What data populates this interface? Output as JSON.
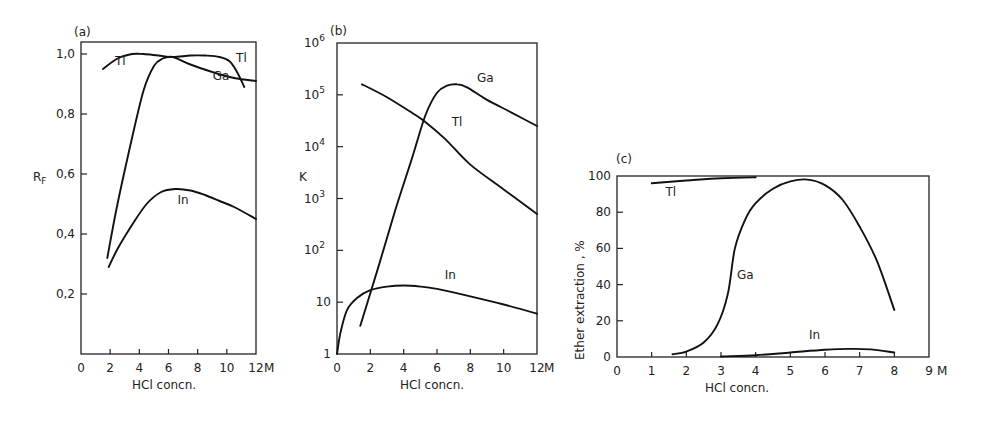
{
  "figure": {
    "panels": [
      "(a)",
      "(b)",
      "(c)"
    ]
  },
  "chart_data": [
    {
      "type": "line",
      "panel": "(a)",
      "title": "",
      "xlabel": "HCl concn.",
      "x_unit": "M",
      "ylabel": "RF",
      "xlim": [
        0,
        12
      ],
      "ylim": [
        0,
        1.05
      ],
      "x_ticks": [
        0,
        2,
        4,
        6,
        8,
        10,
        12
      ],
      "x_tick_labels": [
        "0",
        "2",
        "4",
        "6",
        "8",
        "10",
        "12"
      ],
      "y_ticks": [
        0.2,
        0.4,
        0.6,
        0.8,
        1.0
      ],
      "y_tick_labels": [
        "0,2",
        "0,4",
        "0,6",
        "0,8",
        "1,0"
      ],
      "grid": false,
      "series": [
        {
          "name": "Tl",
          "x": [
            1.5,
            2.5,
            3.5,
            4.3,
            5.3,
            6.3,
            7.5,
            8.5,
            9.5,
            10.2,
            10.7,
            11.2
          ],
          "y": [
            0.95,
            0.985,
            1.0,
            1.0,
            0.995,
            0.99,
            0.995,
            0.995,
            0.99,
            0.975,
            0.94,
            0.89
          ]
        },
        {
          "name": "Ga",
          "x": [
            1.8,
            2.5,
            3.5,
            4.3,
            5.0,
            5.6,
            6.3,
            7.5,
            9.0,
            10.5,
            12.0
          ],
          "y": [
            0.32,
            0.5,
            0.72,
            0.88,
            0.96,
            0.985,
            0.99,
            0.965,
            0.94,
            0.92,
            0.91
          ]
        },
        {
          "name": "In",
          "x": [
            1.9,
            2.5,
            3.5,
            4.5,
            5.5,
            6.5,
            7.5,
            8.5,
            9.5,
            10.5,
            12.0
          ],
          "y": [
            0.29,
            0.35,
            0.43,
            0.5,
            0.54,
            0.55,
            0.545,
            0.53,
            0.51,
            0.49,
            0.45
          ]
        }
      ],
      "annotations": [
        {
          "text": "Tl",
          "x": 2.7,
          "y": 0.965
        },
        {
          "text": "Tl",
          "x": 11.0,
          "y": 0.975
        },
        {
          "text": "Ga",
          "x": 9.6,
          "y": 0.915
        },
        {
          "text": "In",
          "x": 7.0,
          "y": 0.5
        }
      ]
    },
    {
      "type": "line",
      "panel": "(b)",
      "title": "",
      "xlabel": "HCl concn.",
      "x_unit": "M",
      "ylabel": "K",
      "yscale": "log",
      "xlim": [
        0,
        12
      ],
      "ylim": [
        1,
        1000000
      ],
      "x_ticks": [
        0,
        2,
        4,
        6,
        8,
        10,
        12
      ],
      "x_tick_labels": [
        "0",
        "2",
        "4",
        "6",
        "8",
        "10",
        "12"
      ],
      "y_ticks": [
        1,
        10,
        100,
        1000,
        10000,
        100000,
        1000000
      ],
      "y_tick_labels": [
        "1",
        "10",
        "10^2",
        "10^3",
        "10^4",
        "10^5",
        "10^6"
      ],
      "grid": false,
      "series": [
        {
          "name": "Tl",
          "x": [
            1.5,
            3.0,
            4.5,
            5.3,
            6.5,
            8.0,
            10.0,
            12.0
          ],
          "y": [
            160000,
            90000,
            45000,
            30000,
            14000,
            4500,
            1500,
            500
          ]
        },
        {
          "name": "Ga",
          "x": [
            1.4,
            2.5,
            3.5,
            4.5,
            5.3,
            6.0,
            6.6,
            7.2,
            7.8,
            9.0,
            10.5,
            12.0
          ],
          "y": [
            3.5,
            50,
            600,
            6000,
            40000,
            110000,
            150000,
            160000,
            140000,
            80000,
            45000,
            25000
          ]
        },
        {
          "name": "In",
          "x": [
            0.0,
            0.2,
            0.6,
            1.2,
            2.0,
            3.0,
            4.0,
            5.0,
            6.0,
            8.0,
            10.0,
            12.0
          ],
          "y": [
            1.0,
            2.5,
            7,
            12,
            17,
            20,
            21,
            20,
            18,
            13,
            9,
            6
          ]
        }
      ],
      "annotations": [
        {
          "text": "Ga",
          "x": 8.9,
          "y": 180000
        },
        {
          "text": "Tl",
          "x": 7.2,
          "y": 25000
        },
        {
          "text": "In",
          "x": 6.8,
          "y": 28
        }
      ]
    },
    {
      "type": "line",
      "panel": "(c)",
      "title": "",
      "xlabel": "HCl concn.",
      "x_unit": "M",
      "ylabel": "Ether extraction , %",
      "xlim": [
        0,
        9
      ],
      "ylim": [
        0,
        100
      ],
      "x_ticks": [
        0,
        1,
        2,
        3,
        4,
        5,
        6,
        7,
        8,
        9
      ],
      "x_tick_labels": [
        "0",
        "1",
        "2",
        "3",
        "4",
        "5",
        "6",
        "7",
        "8",
        "9"
      ],
      "y_ticks": [
        0,
        20,
        40,
        60,
        80,
        100
      ],
      "y_tick_labels": [
        "0",
        "20",
        "40",
        "60",
        "80",
        "100"
      ],
      "grid": false,
      "series": [
        {
          "name": "Tl",
          "x": [
            1.0,
            2.0,
            3.0,
            4.0
          ],
          "y": [
            96,
            97.5,
            98.8,
            99.3
          ]
        },
        {
          "name": "Ga",
          "x": [
            1.6,
            2.0,
            2.5,
            2.9,
            3.2,
            3.4,
            3.7,
            4.0,
            4.5,
            5.0,
            5.5,
            6.0,
            6.5,
            7.0,
            7.5,
            8.0
          ],
          "y": [
            1.5,
            3,
            8,
            18,
            35,
            60,
            76,
            85,
            93,
            97,
            98,
            95,
            87,
            72,
            53,
            26
          ]
        },
        {
          "name": "In",
          "x": [
            3.0,
            4.0,
            5.0,
            6.0,
            6.7,
            7.3,
            8.0
          ],
          "y": [
            0.3,
            1,
            2.5,
            4,
            4.5,
            4.2,
            2.5
          ]
        }
      ],
      "annotations": [
        {
          "text": "Tl",
          "x": 1.55,
          "y": 89
        },
        {
          "text": "Ga",
          "x": 3.7,
          "y": 43
        },
        {
          "text": "In",
          "x": 5.7,
          "y": 10
        }
      ]
    }
  ]
}
